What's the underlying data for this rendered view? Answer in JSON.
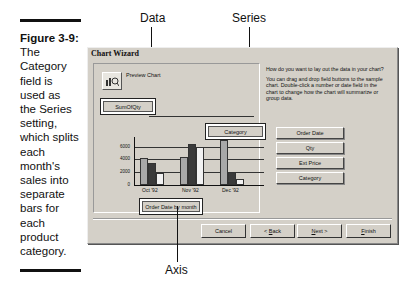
{
  "figure": {
    "label": "Figure 3-9:",
    "caption_lines": [
      "The",
      "Category",
      "field is",
      "used as",
      "the Series",
      "setting,",
      "which splits",
      "each",
      "month's",
      "sales into",
      "separate",
      "bars for",
      "each",
      "product",
      "category."
    ]
  },
  "callouts": {
    "data": "Data",
    "series": "Series",
    "axis": "Axis"
  },
  "dialog": {
    "title": "Chart Wizard",
    "preview_label": "Preview Chart",
    "preview_icon": "preview-chart-icon",
    "data_field": "SumOfQty",
    "series_field": "Category",
    "axis_field": "Order Date by month",
    "instructions": {
      "question": "How do you want to lay out the data in your chart?",
      "help": "You can drag and drop field buttons to the sample chart. Double-click a number or date field in the chart to change how the chart will summarize or group data."
    },
    "field_buttons": [
      "Order Date",
      "Qty",
      "Ext Price",
      "Category"
    ],
    "buttons": {
      "cancel": "Cancel",
      "back_prefix": "< ",
      "back_key": "B",
      "back_rest": "ack",
      "next_key": "N",
      "next_rest": "ext >",
      "finish_key": "F",
      "finish_rest": "inish"
    }
  },
  "chart_data": {
    "type": "bar",
    "categories": [
      "Oct '92",
      "Nov '92",
      "Dec '92"
    ],
    "series": [
      {
        "name": "Series 1",
        "color": "#a8a8a8",
        "values": [
          4200,
          4300,
          7100
        ]
      },
      {
        "name": "Series 2",
        "color": "#3a3a3a",
        "values": [
          3400,
          6400,
          2000
        ]
      },
      {
        "name": "Series 3",
        "color": "#f2f2f2",
        "values": [
          1900,
          5900,
          900
        ]
      }
    ],
    "yticks": [
      "6000",
      "4000",
      "2000",
      "0"
    ],
    "ylim": [
      0,
      7500
    ],
    "title": "",
    "xlabel": "",
    "ylabel": "",
    "grid": true
  }
}
